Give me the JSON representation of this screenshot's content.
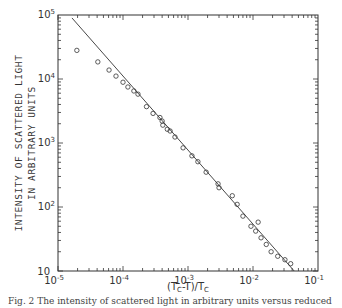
{
  "chart_data": {
    "type": "scatter",
    "title": "",
    "xlabel": "(T_C-T)/T_C",
    "ylabel_lines": [
      "INTENSITY OF SCATTERED LIGHT",
      "IN ARBITRARY UNITS"
    ],
    "xscale": "log",
    "yscale": "log",
    "xlim": [
      1e-05,
      0.1
    ],
    "ylim": [
      10,
      100000
    ],
    "grid": false,
    "legend": null,
    "x_ticks": [
      {
        "base": "10",
        "exp": "-5",
        "value": 1e-05
      },
      {
        "base": "10",
        "exp": "-4",
        "value": 0.0001
      },
      {
        "base": "10",
        "exp": "-3",
        "value": 0.001
      },
      {
        "base": "10",
        "exp": "-2",
        "value": 0.01
      },
      {
        "base": "10",
        "exp": "-1",
        "value": 0.1
      }
    ],
    "y_ticks": [
      {
        "base": "10",
        "exp": "",
        "value": 10
      },
      {
        "base": "10",
        "exp": "2",
        "value": 100
      },
      {
        "base": "10",
        "exp": "3",
        "value": 1000
      },
      {
        "base": "10",
        "exp": "4",
        "value": 10000
      },
      {
        "base": "10",
        "exp": "5",
        "value": 100000
      }
    ],
    "series": [
      {
        "name": "measured intensity",
        "marker": "open-circle",
        "x": [
          1.95e-05,
          4.1e-05,
          6.1e-05,
          7.8e-05,
          0.0001,
          0.000119,
          0.000147,
          0.00017,
          0.00023,
          0.00029,
          0.00037,
          0.0004,
          0.00041,
          0.00048,
          0.00053,
          0.00063,
          0.00084,
          0.00115,
          0.00142,
          0.0019,
          0.0029,
          0.003,
          0.0048,
          0.0057,
          0.007,
          0.0093,
          0.011,
          0.012,
          0.0133,
          0.016,
          0.019,
          0.024,
          0.031,
          0.038
        ],
        "y": [
          28000,
          18500,
          13800,
          11100,
          8900,
          7500,
          6500,
          5800,
          3700,
          2900,
          2500,
          2200,
          1900,
          1640,
          1540,
          1240,
          840,
          630,
          510,
          350,
          230,
          200,
          150,
          110,
          72,
          50,
          42,
          58,
          33,
          26,
          20,
          17,
          15,
          13
        ]
      },
      {
        "name": "power-law fit",
        "type": "line",
        "x": [
          1.64e-05,
          0.043
        ],
        "y": [
          90000,
          10
        ]
      }
    ]
  },
  "caption": "Fig. 2 The intensity of scattered light in arbitrary units versus reduced"
}
